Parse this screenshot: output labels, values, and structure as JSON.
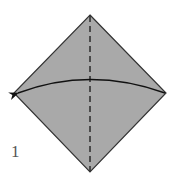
{
  "diagram": {
    "type": "origami-instruction",
    "step_number": "1",
    "paper": {
      "shape": "square-on-point",
      "fill": "#a9a9a9",
      "edge": "#333333"
    },
    "creases": [
      {
        "kind": "valley-fold",
        "style": "dashed",
        "orientation": "vertical",
        "through": "top-to-bottom-corner"
      }
    ],
    "arrows": [
      {
        "kind": "fold-arrow",
        "from": "right-corner",
        "to": "left-corner",
        "shape": "curved"
      }
    ]
  }
}
